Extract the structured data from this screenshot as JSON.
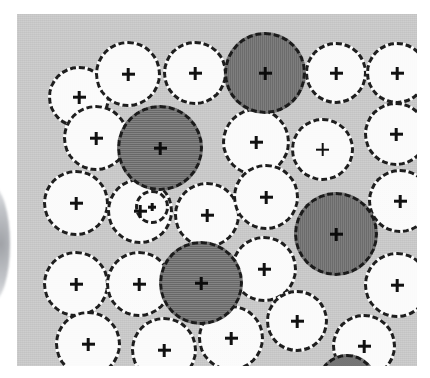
{
  "figure": {
    "canvas": {
      "width": 430,
      "height": 378,
      "background": "#ffffff"
    },
    "panel": {
      "name": "gray-field-panel",
      "x": 17,
      "y": 14,
      "width": 400,
      "height": 352,
      "fill": "#c7c7c7"
    },
    "edge_artifact": {
      "name": "left-edge-arc-artifact",
      "description": "Faint dark crescent bleeding in from the left margin outside the panel",
      "x": -26,
      "y": 186,
      "width": 36,
      "height": 116
    },
    "legend": {
      "light_fill": "#fbfbfb",
      "dark_fill": "#6f6f6f",
      "outline": "#1d1d1d",
      "outline_style": "dashed",
      "marker": "crosshair-plus",
      "marker_color": "#111111"
    },
    "counts": {
      "total": 29,
      "light": 24,
      "dark": 5,
      "rows": 5
    }
  },
  "chart_data": {
    "type": "scatter",
    "xlabel": "",
    "ylabel": "",
    "xlim": [
      0,
      400
    ],
    "ylim": [
      0,
      352
    ],
    "grid": false,
    "legend": "none",
    "series": [
      {
        "name": "light-circle",
        "fill": "#fbfbfb",
        "values": [
          {
            "id": "r1c1",
            "row": 1,
            "x": 31,
            "y": 52,
            "d": 62
          },
          {
            "id": "r1c2",
            "row": 1,
            "x": 78,
            "y": 27,
            "d": 66
          },
          {
            "id": "r1c3",
            "row": 1,
            "x": 146,
            "y": 27,
            "d": 64
          },
          {
            "id": "r1c5",
            "row": 1,
            "x": 288,
            "y": 28,
            "d": 62
          },
          {
            "id": "r1c6",
            "row": 1,
            "x": 349,
            "y": 28,
            "d": 62
          },
          {
            "id": "r2c1",
            "row": 2,
            "x": 46,
            "y": 91,
            "d": 66
          },
          {
            "id": "r2c3",
            "row": 2,
            "x": 205,
            "y": 94,
            "d": 68
          },
          {
            "id": "r2c4",
            "row": 2,
            "x": 274,
            "y": 104,
            "d": 63
          },
          {
            "id": "r2c5",
            "row": 2,
            "x": 347,
            "y": 88,
            "d": 64
          },
          {
            "id": "r3c1",
            "row": 3,
            "x": 26,
            "y": 156,
            "d": 66
          },
          {
            "id": "r3c2",
            "row": 3,
            "x": 90,
            "y": 164,
            "d": 66
          },
          {
            "id": "r3c3",
            "row": 3,
            "x": 157,
            "y": 168,
            "d": 66
          },
          {
            "id": "r3c4",
            "row": 3,
            "x": 216,
            "y": 150,
            "d": 66
          },
          {
            "id": "r3c6",
            "row": 3,
            "x": 351,
            "y": 155,
            "d": 64
          },
          {
            "id": "r4c1",
            "row": 4,
            "x": 26,
            "y": 237,
            "d": 66
          },
          {
            "id": "r4c2",
            "row": 4,
            "x": 89,
            "y": 237,
            "d": 66
          },
          {
            "id": "r4c4",
            "row": 4,
            "x": 214,
            "y": 222,
            "d": 66
          },
          {
            "id": "r4c5",
            "row": 4,
            "x": 347,
            "y": 238,
            "d": 66
          },
          {
            "id": "r5c1",
            "row": 5,
            "x": 38,
            "y": 297,
            "d": 66
          },
          {
            "id": "r5c2",
            "row": 5,
            "x": 114,
            "y": 303,
            "d": 66
          },
          {
            "id": "r5c3",
            "row": 5,
            "x": 181,
            "y": 291,
            "d": 66
          },
          {
            "id": "r5c4",
            "row": 5,
            "x": 249,
            "y": 276,
            "d": 62
          },
          {
            "id": "r5c5",
            "row": 5,
            "x": 315,
            "y": 300,
            "d": 64
          },
          {
            "id": "r2c2b",
            "row": 2,
            "x": 118,
            "y": 176,
            "d": 34
          }
        ]
      },
      {
        "name": "dark-circle",
        "fill": "#6f6f6f",
        "values": [
          {
            "id": "d1",
            "row": 1,
            "x": 207,
            "y": 18,
            "d": 82
          },
          {
            "id": "d2",
            "row": 2,
            "x": 100,
            "y": 91,
            "d": 86
          },
          {
            "id": "d3",
            "row": 3,
            "x": 277,
            "y": 178,
            "d": 84
          },
          {
            "id": "d4",
            "row": 4,
            "x": 142,
            "y": 227,
            "d": 84
          },
          {
            "id": "d5",
            "row": 5,
            "x": 300,
            "y": 340,
            "d": 60
          }
        ]
      }
    ]
  }
}
